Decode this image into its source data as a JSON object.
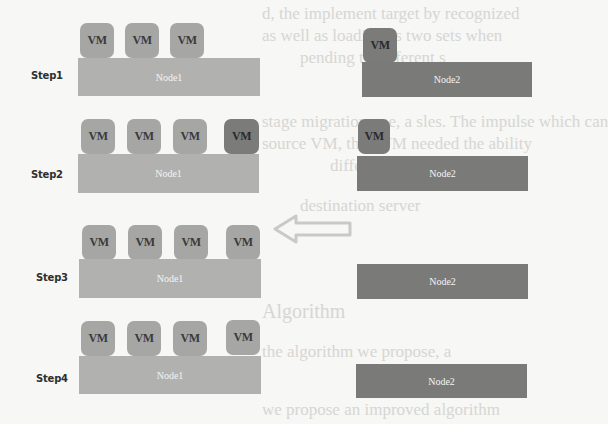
{
  "figure": {
    "background_bleed_text": [
      "d, the implement target by recognized",
      "as well as loading as two sets when",
      "pending to different s",
      "stage migration one, a sles. The impulse which can",
      "source VM, then VM needed the ability",
      "different",
      "destination server"
    ],
    "bleed_heading": "Algorithm",
    "bleed_bottom": [
      "the algorithm we propose, a",
      "we propose an improved algorithm"
    ],
    "colors": {
      "node1": "#b1b1b0",
      "node2": "#7a7a79",
      "vm_light": "#a6a6a5",
      "vm_dark": "#7b7b7a",
      "arrow": "#c9c9c7"
    },
    "arrow": {
      "direction": "left",
      "meaning": "migration-back-to-node1"
    },
    "steps": [
      {
        "label": "Step1",
        "node1": {
          "label": "Node1",
          "vms": [
            "VM",
            "VM",
            "VM"
          ]
        },
        "node2": {
          "label": "Node2",
          "vms": [
            "VM"
          ]
        }
      },
      {
        "label": "Step2",
        "node1": {
          "label": "Node1",
          "vms": [
            "VM",
            "VM",
            "VM",
            "VM"
          ]
        },
        "node2": {
          "label": "Node2",
          "vms": [
            "VM"
          ]
        }
      },
      {
        "label": "Step3",
        "node1": {
          "label": "Node1",
          "vms": [
            "VM",
            "VM",
            "VM",
            "VM"
          ]
        },
        "node2": {
          "label": "Node2",
          "vms": []
        }
      },
      {
        "label": "Step4",
        "node1": {
          "label": "Node1",
          "vms": [
            "VM",
            "VM",
            "VM",
            "VM"
          ]
        },
        "node2": {
          "label": "Node2",
          "vms": []
        }
      }
    ]
  }
}
